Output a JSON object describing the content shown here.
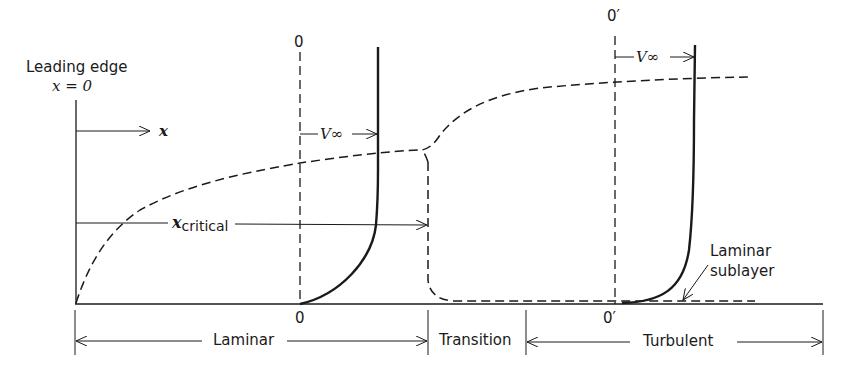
{
  "figure": {
    "leading_edge": {
      "line1": "Leading edge",
      "line2": "x = 0"
    },
    "x_axis_label": "x",
    "x_critical": {
      "symbol": "x",
      "subscript": "critical"
    },
    "laminar_profile": {
      "origin_label_top": "0",
      "origin_label_bottom": "0",
      "velocity_label": "V∞"
    },
    "turbulent_profile": {
      "origin_label_top": "0′",
      "origin_label_bottom": "0′",
      "velocity_label": "V∞"
    },
    "sublayer_label": {
      "line1": "Laminar",
      "line2": "sublayer"
    },
    "regions": [
      {
        "name": "Laminar"
      },
      {
        "name": "Transition"
      },
      {
        "name": "Turbulent"
      }
    ],
    "colors": {
      "ink": "#1a1a1a",
      "background": "#ffffff"
    }
  }
}
